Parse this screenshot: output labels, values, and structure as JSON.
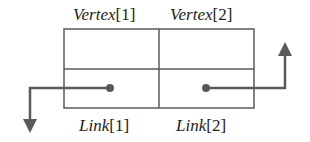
{
  "diagram": {
    "cells": {
      "top": [
        {
          "name": "Vertex",
          "index": "[1]"
        },
        {
          "name": "Vertex",
          "index": "[2]"
        }
      ],
      "bottom": [
        {
          "name": "Link",
          "index": "[1]"
        },
        {
          "name": "Link",
          "index": "[2]"
        }
      ]
    },
    "arrows": [
      {
        "from": "Link[1]",
        "direction": "left-then-down"
      },
      {
        "from": "Link[2]",
        "direction": "right-then-up"
      }
    ],
    "colors": {
      "line": "#5a5a5a",
      "text": "#222222",
      "background": "#ffffff"
    }
  }
}
